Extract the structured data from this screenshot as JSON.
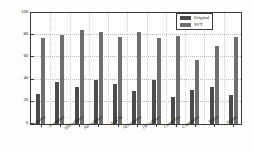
{
  "chart_data": {
    "type": "bar",
    "title": "",
    "xlabel": "",
    "ylabel": "BLEU@n-4 (%)",
    "ylim": [
      0,
      100
    ],
    "yticks": [
      0,
      20,
      40,
      60,
      80,
      100
    ],
    "grid": true,
    "legend_position": "top-right",
    "categories": [
      "softmax",
      "A-softmax",
      "AM-softmax",
      "Arc-softmax",
      "AdaCos",
      "ND-softmax",
      "DP-softmax",
      "Center loss",
      "Contrastive",
      "Triplet",
      "N-pairs"
    ],
    "series": [
      {
        "name": "Original",
        "color": "#4b4b4b",
        "values": [
          27,
          37.5,
          33,
          40,
          36,
          30,
          39.5,
          24,
          30.5,
          33,
          26
        ]
      },
      {
        "name": "SVT",
        "color": "#6f6f6f",
        "values": [
          77.5,
          80.5,
          84.5,
          82.5,
          78,
          82.5,
          77.5,
          79,
          58,
          70,
          78
        ]
      }
    ]
  },
  "legend": {
    "items": [
      {
        "label": "Original"
      },
      {
        "label": "SVT"
      }
    ]
  },
  "axes": {
    "y_title": "BLEU@n-4 (%)",
    "y_tick_labels": [
      "0",
      "20",
      "40",
      "60",
      "80",
      "100"
    ]
  }
}
